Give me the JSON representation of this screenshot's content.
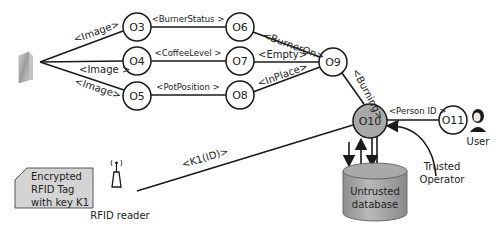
{
  "nodes": {
    "o3": "O3",
    "o4": "O4",
    "o5": "O5",
    "o6": "O6",
    "o7": "O7",
    "o8": "O8",
    "o9": "O9",
    "o10": "O10",
    "o11": "O11"
  },
  "edges": {
    "cam_o3": "<Image>",
    "cam_o4": "<Image >",
    "cam_o5": "<Image>",
    "o3_o6": "<BurnerStatus >",
    "o4_o7": "<CoffeeLevel >",
    "o5_o8": "<PotPosition >",
    "o6_o9": "<BurnerOn>",
    "o7_o9": "<Empty>",
    "o8_o9": "<InPlace>",
    "o9_o10": "<Burning>",
    "o11_o10": "<Person ID >",
    "reader_o10": "<K1(ID)>"
  },
  "labels": {
    "user": "User",
    "trusted_operator_1": "Trusted",
    "trusted_operator_2": "Operator",
    "database_1": "Untrusted",
    "database_2": "database",
    "rfid_reader": "RFID reader",
    "rfid_tag_1": "Encrypted",
    "rfid_tag_2": "RFID Tag",
    "rfid_tag_3": "with key K1"
  },
  "colors": {
    "node_fill": "#ffffff",
    "o10_fill": "#a8a8a8",
    "database_fill": "#a9a9a9",
    "tag_fill": "#d4d4d4",
    "line": "#1a1a1a"
  }
}
